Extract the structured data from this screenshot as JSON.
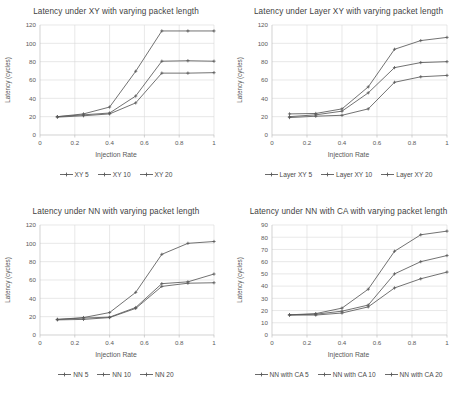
{
  "figure": {
    "background": "#ffffff",
    "series_color": "#595959",
    "grid_color": "#d9d9d9",
    "axis_color": "#bfbfbf",
    "text_color": "#404040"
  },
  "charts": [
    {
      "id": "chart-xy",
      "title": "Latency under XY with varying packet length",
      "xlabel": "Injection Rate",
      "ylabel": "Latency (cycles)",
      "type": "line",
      "x": [
        0.1,
        0.25,
        0.4,
        0.55,
        0.7,
        0.85,
        1
      ],
      "xticks": [
        "0",
        "0.2",
        "0.4",
        "0.6",
        "0.8",
        "1"
      ],
      "xtickvals": [
        0,
        0.2,
        0.4,
        0.6,
        0.8,
        1
      ],
      "xlim": [
        0,
        1
      ],
      "yticks": [
        "0",
        "20",
        "40",
        "60",
        "80",
        "100",
        "120"
      ],
      "ytickvals": [
        0,
        20,
        40,
        60,
        80,
        100,
        120
      ],
      "ylim": [
        0,
        120
      ],
      "grid": true,
      "legend_position": "bottom",
      "series": [
        {
          "name": "XY 5",
          "values": [
            19.5,
            21.0,
            23.0,
            35.0,
            67.5,
            67.5,
            68.0
          ]
        },
        {
          "name": "XY 10",
          "values": [
            20.0,
            22.0,
            24.0,
            42.5,
            80.5,
            81.0,
            80.5
          ]
        },
        {
          "name": "XY 20",
          "values": [
            20.0,
            23.0,
            30.5,
            69.5,
            113.5,
            113.5,
            113.5
          ]
        }
      ]
    },
    {
      "id": "chart-layer-xy",
      "title": "Latency under Layer XY with varying packet length",
      "xlabel": "Injection Rate",
      "ylabel": "Latency  (cycles)",
      "type": "line",
      "x": [
        0.1,
        0.25,
        0.4,
        0.55,
        0.7,
        0.85,
        1
      ],
      "xticks": [
        "0",
        "0.2",
        "0.4",
        "0.6",
        "0.8",
        "1"
      ],
      "xtickvals": [
        0,
        0.2,
        0.4,
        0.6,
        0.8,
        1
      ],
      "xlim": [
        0,
        1
      ],
      "yticks": [
        "0",
        "20",
        "40",
        "60",
        "80",
        "100",
        "120"
      ],
      "ytickvals": [
        0,
        20,
        40,
        60,
        80,
        100,
        120
      ],
      "ylim": [
        0,
        120
      ],
      "grid": true,
      "legend_position": "bottom",
      "series": [
        {
          "name": "Layer XY 5",
          "values": [
            19.0,
            20.5,
            21.5,
            28.5,
            57.5,
            63.5,
            65.0
          ]
        },
        {
          "name": "Layer XY 10",
          "values": [
            20.0,
            22.0,
            26.0,
            46.0,
            73.5,
            79.0,
            80.0
          ]
        },
        {
          "name": "Layer XY 20",
          "values": [
            23.0,
            23.5,
            28.5,
            52.5,
            93.5,
            103.0,
            106.5
          ]
        }
      ]
    },
    {
      "id": "chart-nn",
      "title": "Latency under NN with varying packet length",
      "xlabel": "Injection Rate",
      "ylabel": "Latency (cycles)",
      "type": "line",
      "x": [
        0.1,
        0.25,
        0.4,
        0.55,
        0.7,
        0.85,
        1
      ],
      "xticks": [
        "0",
        "0.2",
        "0.4",
        "0.6",
        "0.8",
        "1"
      ],
      "xtickvals": [
        0,
        0.2,
        0.4,
        0.6,
        0.8,
        1
      ],
      "xlim": [
        0,
        1
      ],
      "yticks": [
        "0",
        "20",
        "40",
        "60",
        "80",
        "100",
        "120"
      ],
      "ytickvals": [
        0,
        20,
        40,
        60,
        80,
        100,
        120
      ],
      "ylim": [
        0,
        120
      ],
      "grid": true,
      "legend_position": "bottom",
      "series": [
        {
          "name": "NN 5",
          "values": [
            16.5,
            17.0,
            19.0,
            29.0,
            53.0,
            56.5,
            57.0
          ]
        },
        {
          "name": "NN 10",
          "values": [
            17.0,
            18.5,
            19.5,
            30.0,
            56.0,
            58.0,
            66.5
          ]
        },
        {
          "name": "NN 20",
          "values": [
            17.0,
            19.0,
            24.5,
            46.5,
            88.0,
            100.0,
            102.0
          ]
        }
      ]
    },
    {
      "id": "chart-nn-ca",
      "title": "Latency under NN with CA with varying packet length",
      "xlabel": "Injection Rate",
      "ylabel": "Latency (cycles)",
      "type": "line",
      "x": [
        0.1,
        0.25,
        0.4,
        0.55,
        0.7,
        0.85,
        1
      ],
      "xticks": [
        "0",
        "0.2",
        "0.4",
        "0.6",
        "0.8",
        "1"
      ],
      "xtickvals": [
        0,
        0.2,
        0.4,
        0.6,
        0.8,
        1
      ],
      "xlim": [
        0,
        1
      ],
      "yticks": [
        "0",
        "10",
        "20",
        "30",
        "40",
        "50",
        "60",
        "70",
        "80",
        "90"
      ],
      "ytickvals": [
        0,
        10,
        20,
        30,
        40,
        50,
        60,
        70,
        80,
        90
      ],
      "ylim": [
        0,
        90
      ],
      "grid": true,
      "legend_position": "bottom",
      "series": [
        {
          "name": "NN with CA 5",
          "values": [
            16.3,
            16.3,
            18.0,
            23.0,
            38.5,
            46.0,
            51.5
          ]
        },
        {
          "name": "NN with CA 10",
          "values": [
            16.5,
            17.0,
            19.5,
            24.5,
            50.0,
            60.0,
            65.0
          ]
        },
        {
          "name": "NN with CA 20",
          "values": [
            16.5,
            17.5,
            22.0,
            37.5,
            68.5,
            82.0,
            85.0
          ]
        }
      ]
    }
  ]
}
